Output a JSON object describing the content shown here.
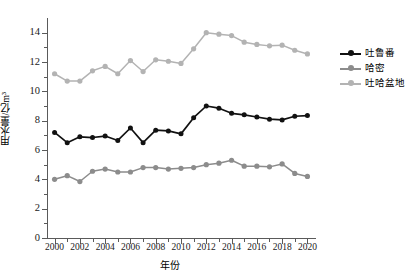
{
  "chart_data": {
    "type": "line",
    "title": "",
    "xlabel": "年份",
    "ylabel": "用水量/亿m³",
    "x": [
      2000,
      2001,
      2002,
      2003,
      2004,
      2005,
      2006,
      2007,
      2008,
      2009,
      2010,
      2011,
      2012,
      2013,
      2014,
      2015,
      2016,
      2017,
      2018,
      2019,
      2020
    ],
    "xlim": [
      1999.4,
      2020.6
    ],
    "ylim": [
      0,
      15
    ],
    "yticks": [
      0,
      2,
      4,
      6,
      8,
      10,
      12,
      14
    ],
    "ytick_labels": [
      "0",
      "2",
      "4",
      "6",
      "8",
      "10",
      "12",
      "14"
    ],
    "xticks": [
      2000,
      2002,
      2004,
      2006,
      2008,
      2010,
      2012,
      2014,
      2016,
      2018,
      2020
    ],
    "xtick_labels": [
      "2000",
      "2002",
      "2004",
      "2006",
      "2008",
      "2010",
      "2012",
      "2014",
      "2016",
      "2018",
      "2020"
    ],
    "grid": false,
    "legend_position": "right",
    "series": [
      {
        "name": "吐鲁番",
        "color": "#111111",
        "marker": "circle",
        "values": [
          7.2,
          6.5,
          6.9,
          6.85,
          6.95,
          6.65,
          7.5,
          6.5,
          7.35,
          7.3,
          7.1,
          8.2,
          9.0,
          8.85,
          8.5,
          8.4,
          8.25,
          8.1,
          8.05,
          8.3,
          8.35
        ]
      },
      {
        "name": "哈密",
        "color": "#8c8c8c",
        "marker": "circle",
        "values": [
          4.0,
          4.25,
          3.85,
          4.55,
          4.7,
          4.5,
          4.5,
          4.8,
          4.8,
          4.7,
          4.75,
          4.8,
          5.0,
          5.1,
          5.3,
          4.9,
          4.9,
          4.85,
          5.05,
          4.4,
          4.2
        ]
      },
      {
        "name": "吐哈盆地",
        "color": "#b3b3b3",
        "marker": "circle",
        "values": [
          11.2,
          10.7,
          10.7,
          11.4,
          11.7,
          11.2,
          12.1,
          11.35,
          12.15,
          12.05,
          11.9,
          12.9,
          14.0,
          13.9,
          13.8,
          13.35,
          13.2,
          13.1,
          13.15,
          12.8,
          12.55
        ]
      }
    ]
  },
  "axis_color": "#5a5a5a",
  "background": "#ffffff"
}
